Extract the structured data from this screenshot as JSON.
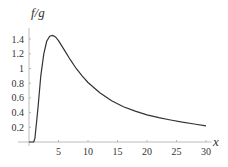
{
  "chart_data": {
    "type": "line",
    "title": "",
    "xlabel": "x",
    "ylabel": "f/g",
    "xlim": [
      0,
      31
    ],
    "ylim": [
      0,
      1.55
    ],
    "x_ticks": [
      5,
      10,
      15,
      20,
      25,
      30
    ],
    "y_ticks": [
      0.2,
      0.4,
      0.6,
      0.8,
      1,
      1.2,
      1.4
    ],
    "x_tick_labels": [
      "5",
      "10",
      "15",
      "20",
      "25",
      "30"
    ],
    "y_tick_labels": [
      "0.2",
      "0.4",
      "0.6",
      "0.8",
      "1",
      "1.2",
      "1.4"
    ],
    "grid": false,
    "legend": null,
    "series": [
      {
        "name": "f/g",
        "color": "#333333",
        "x": [
          0,
          0.8,
          1.0,
          1.5,
          2.0,
          2.5,
          3.0,
          3.5,
          4.0,
          4.5,
          5.0,
          6.0,
          7.0,
          8.0,
          9.0,
          10.0,
          12.0,
          14.0,
          16.0,
          18.0,
          20.0,
          22.0,
          24.0,
          26.0,
          28.0,
          30.0
        ],
        "y": [
          0,
          0,
          0.05,
          0.45,
          0.9,
          1.2,
          1.37,
          1.44,
          1.45,
          1.43,
          1.38,
          1.25,
          1.12,
          1.0,
          0.9,
          0.81,
          0.67,
          0.56,
          0.48,
          0.42,
          0.37,
          0.33,
          0.3,
          0.27,
          0.245,
          0.22
        ]
      }
    ]
  }
}
